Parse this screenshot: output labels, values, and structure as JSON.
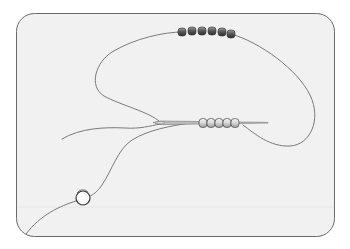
{
  "diagram": {
    "title": "",
    "colors": {
      "background": "#ffffff",
      "panel_fill": "#f1f1f1",
      "panel_border": "#6a6a6a",
      "thread": "#7a7a7a",
      "needle": "#8a8a8a",
      "dark_bead": "#4a4a4a",
      "light_bead": "#d8d8d8",
      "stop_bead": "#ffffff"
    },
    "panel": {
      "x": 16.5,
      "y": 13.5,
      "width": 318,
      "height": 223,
      "radius": 18
    },
    "top_beads": {
      "count": 6,
      "cx": [
        182,
        192,
        202,
        212,
        222,
        231
      ],
      "cy": [
        32,
        31,
        31,
        31,
        32,
        34
      ],
      "r": 4.5
    },
    "needle_beads": {
      "count": 5,
      "cx": [
        203,
        211,
        219,
        227,
        235
      ],
      "cy": 123,
      "r": 4.2
    },
    "stop_bead": {
      "cx": 83,
      "cy": 198,
      "r": 7
    }
  }
}
